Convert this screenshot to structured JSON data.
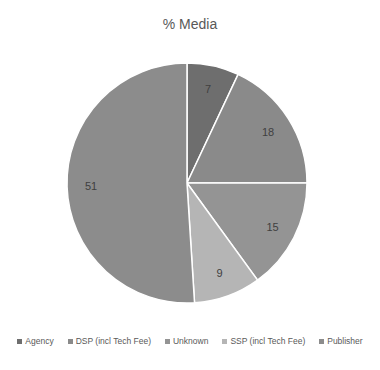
{
  "chart_data": {
    "type": "pie",
    "title": "% Media",
    "categories": [
      "Agency",
      "DSP (incl Tech Fee)",
      "Unknown",
      "SSP (incl Tech Fee)",
      "Publisher"
    ],
    "values": [
      7,
      18,
      15,
      9,
      51
    ],
    "colors": [
      "#6e6e6e",
      "#8a8a8a",
      "#949494",
      "#b5b5b5",
      "#8c8c8c"
    ],
    "data_labels": [
      "7",
      "18",
      "15",
      "9",
      "51"
    ],
    "start_angle_deg": 0,
    "direction": "clockwise",
    "legend_position": "bottom"
  },
  "title": "% Media",
  "legend": [
    {
      "label": "Agency",
      "color": "#6e6e6e"
    },
    {
      "label": "DSP (incl Tech Fee)",
      "color": "#8a8a8a"
    },
    {
      "label": "Unknown",
      "color": "#949494"
    },
    {
      "label": "SSP (incl Tech Fee)",
      "color": "#b5b5b5"
    },
    {
      "label": "Publisher",
      "color": "#8c8c8c"
    }
  ]
}
